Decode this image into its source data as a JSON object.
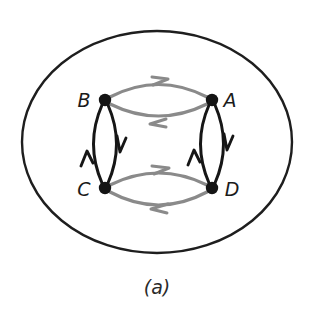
{
  "figure": {
    "caption": "(a)",
    "boundary": {
      "shape": "ellipse",
      "name": "outer-boundary-ellipse",
      "cx": 157,
      "cy": 142,
      "rx": 135,
      "ry": 111,
      "stroke": "#1e1e1e",
      "stroke_width": 2.4
    },
    "nodes": [
      {
        "id": "A",
        "label": "A",
        "x": 212,
        "y": 100,
        "label_x": 228,
        "label_y": 100,
        "radius": 6.2,
        "color": "#141414"
      },
      {
        "id": "B",
        "label": "B",
        "x": 105,
        "y": 100,
        "label_x": 84,
        "label_y": 100,
        "radius": 6.2,
        "color": "#141414"
      },
      {
        "id": "C",
        "label": "C",
        "x": 105,
        "y": 188,
        "label_x": 84,
        "label_y": 190,
        "radius": 6.2,
        "color": "#141414"
      },
      {
        "id": "D",
        "label": "D",
        "x": 212,
        "y": 188,
        "label_x": 230,
        "label_y": 190,
        "radius": 6.2,
        "color": "#141414"
      }
    ],
    "edges": [
      {
        "id": "B-to-A",
        "from": "B",
        "to": "A",
        "color": "#8a8a8a",
        "stroke_width": 3.2,
        "bow": "up",
        "orientation": "horizontal",
        "arrow_dir": "right",
        "position": "top"
      },
      {
        "id": "A-to-B",
        "from": "A",
        "to": "B",
        "color": "#8a8a8a",
        "stroke_width": 3.2,
        "bow": "down",
        "orientation": "horizontal",
        "arrow_dir": "left",
        "position": "top"
      },
      {
        "id": "C-to-D",
        "from": "C",
        "to": "D",
        "color": "#8a8a8a",
        "stroke_width": 3.2,
        "bow": "up",
        "orientation": "horizontal",
        "arrow_dir": "right",
        "position": "bottom"
      },
      {
        "id": "D-to-C",
        "from": "D",
        "to": "C",
        "color": "#8a8a8a",
        "stroke_width": 3.2,
        "bow": "down",
        "orientation": "horizontal",
        "arrow_dir": "left",
        "position": "bottom"
      },
      {
        "id": "B-to-C",
        "from": "B",
        "to": "C",
        "color": "#161616",
        "stroke_width": 3.0,
        "bow": "right",
        "orientation": "vertical",
        "arrow_dir": "down",
        "position": "left"
      },
      {
        "id": "C-to-B",
        "from": "C",
        "to": "B",
        "color": "#161616",
        "stroke_width": 3.0,
        "bow": "left",
        "orientation": "vertical",
        "arrow_dir": "up",
        "position": "left"
      },
      {
        "id": "A-to-D",
        "from": "A",
        "to": "D",
        "color": "#161616",
        "stroke_width": 3.0,
        "bow": "right",
        "orientation": "vertical",
        "arrow_dir": "down",
        "position": "right"
      },
      {
        "id": "D-to-A",
        "from": "D",
        "to": "A",
        "color": "#161616",
        "stroke_width": 3.0,
        "bow": "left",
        "orientation": "vertical",
        "arrow_dir": "up",
        "position": "right"
      }
    ],
    "colors": {
      "background": "#ffffff",
      "boundary_stroke": "#1e1e1e",
      "gray_edge": "#8a8a8a",
      "black_edge": "#161616",
      "node_fill": "#141414",
      "label_text": "#1b1b1b",
      "caption_text": "#2a2a2a"
    }
  }
}
